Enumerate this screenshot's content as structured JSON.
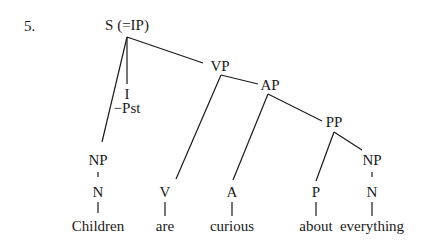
{
  "example_number": "5.",
  "tree": {
    "root": "S (=IP)",
    "infl": {
      "label": "I",
      "feature": "−Pst"
    },
    "subject": {
      "phrase": "NP",
      "head": "N",
      "word": "Children"
    },
    "vp": {
      "label": "VP",
      "head": "V",
      "word": "are"
    },
    "ap": {
      "label": "AP",
      "head": "A",
      "word": "curious"
    },
    "pp": {
      "label": "PP",
      "head": "P",
      "word": "about"
    },
    "object": {
      "phrase": "NP",
      "head": "N",
      "word": "everything"
    }
  },
  "line_color": "#1a1a1a"
}
